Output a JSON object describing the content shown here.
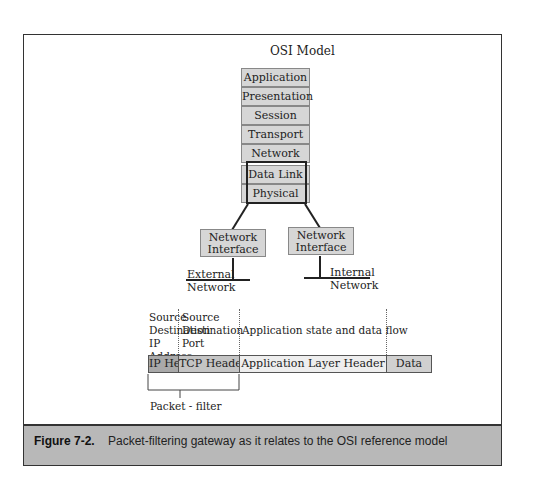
{
  "figure": {
    "title": "OSI Model",
    "osi_layers": [
      "Application",
      "Presentation",
      "Session",
      "Transport",
      "Network",
      "Data Link",
      "Physical"
    ],
    "highlighted_layers": [
      "Data Link",
      "Physical"
    ],
    "network_interfaces": [
      {
        "label": "Network Interface",
        "network": "External Network"
      },
      {
        "label": "Network Interface",
        "network": "Internal Network"
      }
    ],
    "packet": {
      "annotations": [
        {
          "text": "Source Destination IP Address"
        },
        {
          "text": "Source Destination Port"
        },
        {
          "text": "Application state and data flow"
        }
      ],
      "segments": [
        {
          "label": "IP Header",
          "color": "#a9a9a9"
        },
        {
          "label": "TCP Header",
          "color": "#c4c4c4"
        },
        {
          "label": "Application Layer Header",
          "color": "#eeeeee"
        },
        {
          "label": "Data",
          "color": "#d0d0d0"
        }
      ],
      "bracket_label": "Packet - filter"
    }
  },
  "caption": {
    "label": "Figure 7-2.",
    "text": "Packet-filtering gateway as it relates to the OSI reference model"
  }
}
